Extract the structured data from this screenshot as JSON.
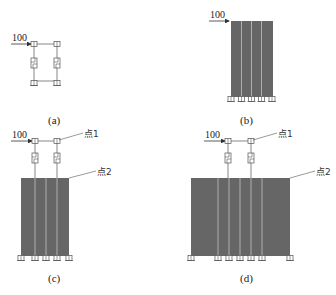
{
  "figure": {
    "colors": {
      "wall_fill": "#666666",
      "wall_stripe": "#b8b8b8",
      "line": "#555555",
      "text": "#222222",
      "background": "#ffffff"
    },
    "panels": [
      {
        "id": "a",
        "caption": "(a)",
        "load_label": "100",
        "point1_label": null,
        "point2_label": null,
        "description": "Two-column frame with dampers, no wall"
      },
      {
        "id": "b",
        "caption": "(b)",
        "load_label": "100",
        "point1_label": null,
        "point2_label": null,
        "description": "Shear wall only, 4 strips, 5 supports"
      },
      {
        "id": "c",
        "caption": "(c)",
        "load_label": "100",
        "point1_label": "点1",
        "point2_label": "点2",
        "description": "Frame with dampers above narrow wall, 4 strips, 5 supports"
      },
      {
        "id": "d",
        "caption": "(d)",
        "load_label": "100",
        "point1_label": "点1",
        "point2_label": "点2",
        "description": "Frame with dampers above wide wall, 6 strips, 7 supports"
      }
    ]
  }
}
